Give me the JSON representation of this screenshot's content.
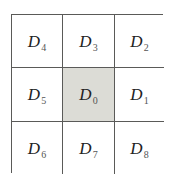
{
  "diagram": {
    "type": "3x3 grid",
    "highlight_color": "#dcdcd6",
    "line_color": "#5a5a58",
    "cells": [
      {
        "row": 0,
        "col": 0,
        "symbol": "D",
        "subscript": "4",
        "shaded": false
      },
      {
        "row": 0,
        "col": 1,
        "symbol": "D",
        "subscript": "3",
        "shaded": false
      },
      {
        "row": 0,
        "col": 2,
        "symbol": "D",
        "subscript": "2",
        "shaded": false
      },
      {
        "row": 1,
        "col": 0,
        "symbol": "D",
        "subscript": "5",
        "shaded": false
      },
      {
        "row": 1,
        "col": 1,
        "symbol": "D",
        "subscript": "0",
        "shaded": true
      },
      {
        "row": 1,
        "col": 2,
        "symbol": "D",
        "subscript": "1",
        "shaded": false
      },
      {
        "row": 2,
        "col": 0,
        "symbol": "D",
        "subscript": "6",
        "shaded": false
      },
      {
        "row": 2,
        "col": 1,
        "symbol": "D",
        "subscript": "7",
        "shaded": false
      },
      {
        "row": 2,
        "col": 2,
        "symbol": "D",
        "subscript": "8",
        "shaded": false
      }
    ]
  }
}
